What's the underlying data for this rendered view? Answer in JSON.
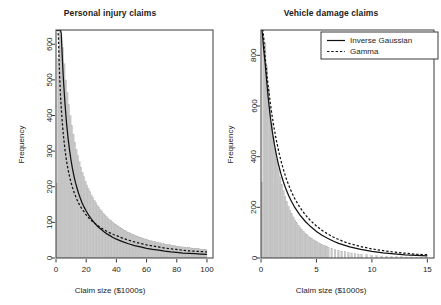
{
  "figure": {
    "panels": [
      "personal-injury",
      "vehicle-damage"
    ],
    "background": "#ffffff",
    "foreground": "#1c1c1c",
    "hist_fill": "#c9c9c9",
    "hist_border": "#b0b0b0"
  },
  "legend": {
    "position": "top-right-of-right-panel",
    "entries": [
      {
        "label": "Inverse Gaussian",
        "style": "solid"
      },
      {
        "label": "Gamma",
        "style": "dashed"
      }
    ]
  },
  "chart_data": [
    {
      "type": "histogram",
      "id": "personal-injury",
      "title": "Personal injury claims",
      "xlabel": "Claim size ($1000s)",
      "ylabel": "Frequency",
      "xlim": [
        0,
        104
      ],
      "ylim": [
        0,
        640
      ],
      "xticks": [
        0,
        20,
        40,
        60,
        80,
        100
      ],
      "yticks": [
        0,
        100,
        200,
        300,
        400,
        500,
        600
      ],
      "grid": false,
      "bin_width": 1,
      "bin_centers": [
        0.5,
        1.5,
        2.5,
        3.5,
        4.5,
        5.5,
        6.5,
        7.5,
        8.5,
        9.5,
        10.5,
        11.5,
        12.5,
        13.5,
        14.5,
        15.5,
        16.5,
        17.5,
        18.5,
        19.5,
        20.5,
        21.5,
        22.5,
        23.5,
        24.5,
        25.5,
        26.5,
        27.5,
        28.5,
        29.5,
        30.5,
        31.5,
        32.5,
        33.5,
        34.5,
        35.5,
        36.5,
        37.5,
        38.5,
        39.5,
        40.5,
        41.5,
        42.5,
        43.5,
        44.5,
        45.5,
        46.5,
        47.5,
        48.5,
        49.5,
        50.5,
        51.5,
        52.5,
        53.5,
        54.5,
        55.5,
        56.5,
        57.5,
        58.5,
        59.5,
        60.5,
        61.5,
        62.5,
        63.5,
        64.5,
        65.5,
        66.5,
        67.5,
        68.5,
        69.5,
        70.5,
        71.5,
        72.5,
        73.5,
        74.5,
        75.5,
        76.5,
        77.5,
        78.5,
        79.5,
        80.5,
        81.5,
        82.5,
        83.5,
        84.5,
        85.5,
        86.5,
        87.5,
        88.5,
        89.5,
        90.5,
        91.5,
        92.5,
        93.5,
        94.5,
        95.5,
        96.5,
        97.5,
        98.5,
        99.5
      ],
      "counts": [
        210,
        560,
        640,
        620,
        590,
        545,
        500,
        465,
        430,
        400,
        372,
        348,
        325,
        305,
        287,
        270,
        255,
        241,
        228,
        216,
        205,
        195,
        186,
        177,
        169,
        162,
        155,
        148,
        142,
        136,
        131,
        126,
        121,
        117,
        112,
        108,
        105,
        101,
        98,
        94,
        91,
        88,
        86,
        83,
        80,
        78,
        76,
        73,
        71,
        69,
        67,
        65,
        64,
        62,
        60,
        59,
        57,
        56,
        54,
        53,
        52,
        50,
        49,
        48,
        47,
        46,
        45,
        44,
        43,
        42,
        41,
        40,
        39,
        38,
        38,
        37,
        36,
        35,
        35,
        34,
        33,
        33,
        32,
        31,
        31,
        30,
        30,
        29,
        29,
        28,
        28,
        27,
        27,
        26,
        26,
        25,
        25,
        24,
        24,
        24
      ],
      "series": [
        {
          "name": "Inverse Gaussian",
          "style": "solid",
          "x": [
            0.4,
            0.8,
            1.2,
            1.6,
            2,
            2.5,
            3,
            3.5,
            4,
            4.5,
            5,
            6,
            7,
            8,
            9,
            10,
            11,
            12,
            13,
            14,
            15,
            16,
            17,
            18,
            19,
            20,
            22,
            24,
            26,
            28,
            30,
            32,
            34,
            36,
            38,
            40,
            44,
            48,
            52,
            56,
            60,
            64,
            68,
            72,
            76,
            80,
            84,
            88,
            92,
            96,
            100
          ],
          "y": [
            640,
            640,
            640,
            640,
            640,
            640,
            640,
            630,
            580,
            535,
            495,
            430,
            378,
            336,
            302,
            273,
            249,
            228,
            210,
            195,
            181,
            169,
            158,
            148,
            140,
            132,
            118,
            106,
            96,
            87,
            80,
            73,
            67,
            62,
            57,
            53,
            46,
            40,
            35,
            31,
            27,
            24,
            22,
            19,
            17,
            16,
            14,
            13,
            12,
            11,
            10
          ]
        },
        {
          "name": "Gamma",
          "style": "dashed",
          "x": [
            0.4,
            0.8,
            1.2,
            1.6,
            2,
            2.5,
            3,
            3.5,
            4,
            4.5,
            5,
            6,
            7,
            8,
            9,
            10,
            11,
            12,
            13,
            14,
            15,
            16,
            17,
            18,
            19,
            20,
            22,
            24,
            26,
            28,
            30,
            32,
            34,
            36,
            38,
            40,
            44,
            48,
            52,
            56,
            60,
            64,
            68,
            72,
            76,
            80,
            84,
            88,
            92,
            96,
            100
          ],
          "y": [
            640,
            640,
            640,
            620,
            560,
            500,
            455,
            420,
            390,
            363,
            340,
            302,
            272,
            248,
            228,
            211,
            197,
            184,
            173,
            163,
            154,
            146,
            139,
            133,
            127,
            121,
            111,
            103,
            96,
            90,
            84,
            79,
            74,
            70,
            66,
            63,
            56,
            50,
            45,
            41,
            37,
            34,
            31,
            28,
            26,
            24,
            22,
            20,
            19,
            18,
            17
          ]
        }
      ]
    },
    {
      "type": "histogram",
      "id": "vehicle-damage",
      "title": "Vehicle damage claims",
      "xlabel": "Claim size ($1000s)",
      "ylabel": "Frequency",
      "xlim": [
        0,
        15.6
      ],
      "ylim": [
        0,
        900
      ],
      "xticks": [
        0,
        5,
        10,
        15
      ],
      "yticks": [
        0,
        200,
        400,
        600,
        800
      ],
      "grid": false,
      "bin_width": 0.15,
      "bin_centers": [
        0.075,
        0.225,
        0.375,
        0.525,
        0.675,
        0.825,
        0.975,
        1.125,
        1.275,
        1.425,
        1.575,
        1.725,
        1.875,
        2.025,
        2.175,
        2.325,
        2.475,
        2.625,
        2.775,
        2.925,
        3.075,
        3.225,
        3.375,
        3.525,
        3.675,
        3.825,
        3.975,
        4.125,
        4.275,
        4.425,
        4.575,
        4.725,
        4.875,
        5.025,
        5.175,
        5.325,
        5.475,
        5.625,
        5.775,
        5.925,
        6.075,
        6.375,
        6.675,
        6.975,
        7.275,
        7.575,
        7.875,
        8.175,
        8.475,
        8.775,
        9.075,
        9.525,
        9.975,
        10.425,
        10.875,
        11.325,
        11.775,
        12.225,
        12.675,
        13.125,
        13.575,
        14.025,
        14.475,
        14.925
      ],
      "counts": [
        300,
        870,
        850,
        760,
        675,
        600,
        535,
        480,
        432,
        390,
        352,
        320,
        291,
        266,
        243,
        223,
        205,
        189,
        175,
        162,
        150,
        139,
        130,
        121,
        113,
        106,
        99,
        93,
        87,
        82,
        77,
        72,
        68,
        64,
        60,
        57,
        54,
        51,
        48,
        45,
        43,
        38,
        34,
        31,
        27,
        25,
        22,
        20,
        18,
        16,
        15,
        13,
        11,
        9,
        8,
        7,
        6,
        5,
        5,
        4,
        4,
        3,
        3,
        3
      ],
      "series": [
        {
          "name": "Inverse Gaussian",
          "style": "solid",
          "x": [
            0.08,
            0.12,
            0.16,
            0.2,
            0.25,
            0.3,
            0.35,
            0.4,
            0.5,
            0.6,
            0.7,
            0.8,
            0.9,
            1.0,
            1.2,
            1.4,
            1.6,
            1.8,
            2.0,
            2.25,
            2.5,
            2.75,
            3.0,
            3.5,
            4.0,
            4.5,
            5.0,
            5.5,
            6.0,
            6.5,
            7.0,
            7.5,
            8.0,
            9.0,
            10.0,
            11.0,
            12.0,
            13.0,
            14.0,
            15.0
          ],
          "y": [
            900,
            890,
            870,
            845,
            820,
            800,
            780,
            755,
            705,
            655,
            612,
            572,
            537,
            505,
            450,
            404,
            365,
            332,
            303,
            272,
            246,
            223,
            203,
            170,
            144,
            123,
            105,
            90,
            78,
            67,
            58,
            51,
            44,
            34,
            26,
            20,
            16,
            12,
            10,
            8
          ]
        },
        {
          "name": "Gamma",
          "style": "dashed",
          "x": [
            0.08,
            0.12,
            0.16,
            0.2,
            0.25,
            0.3,
            0.35,
            0.4,
            0.5,
            0.6,
            0.7,
            0.8,
            0.9,
            1.0,
            1.2,
            1.4,
            1.6,
            1.8,
            2.0,
            2.25,
            2.5,
            2.75,
            3.0,
            3.5,
            4.0,
            4.5,
            5.0,
            5.5,
            6.0,
            6.5,
            7.0,
            7.5,
            8.0,
            9.0,
            10.0,
            11.0,
            12.0,
            13.0,
            14.0,
            15.0
          ],
          "y": [
            900,
            900,
            900,
            890,
            860,
            830,
            805,
            782,
            738,
            697,
            660,
            625,
            592,
            562,
            508,
            461,
            420,
            384,
            352,
            317,
            287,
            261,
            238,
            200,
            170,
            146,
            126,
            109,
            95,
            83,
            73,
            64,
            57,
            45,
            36,
            29,
            23,
            19,
            15,
            13
          ]
        }
      ]
    }
  ]
}
